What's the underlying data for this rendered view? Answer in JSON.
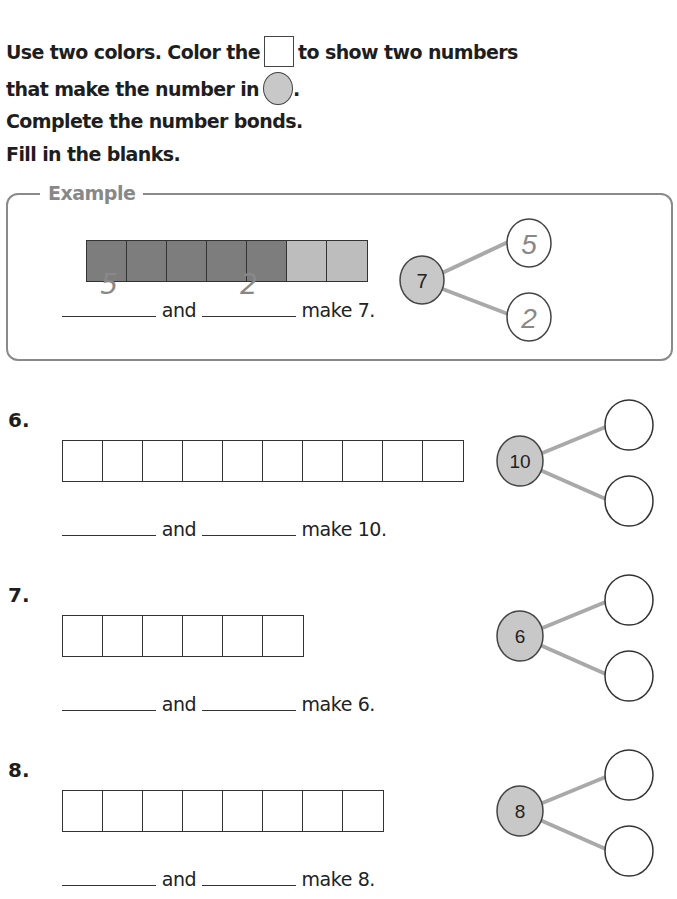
{
  "instructions": {
    "line1_before": "Use two colors. Color the",
    "line1_after": "to show two numbers",
    "line2_before": "that make the number in",
    "line2_after": ".",
    "line3": "Complete the number bonds.",
    "line4": "Fill in the blanks."
  },
  "colors": {
    "dark_fill": "#7d7d7d",
    "light_fill": "#bdbdbd",
    "whole_circle_fill": "#c8c8c8",
    "connector": "#a9a9a9",
    "example_text": "#888888"
  },
  "example": {
    "label": "Example",
    "total": "7",
    "cells": 7,
    "dark_count": 5,
    "part1": "5",
    "part2": "2",
    "and_text": "and",
    "make_text": "make 7."
  },
  "problems": [
    {
      "number": "6.",
      "total": "10",
      "cells": 10,
      "and_text": "and",
      "make_text": "make 10."
    },
    {
      "number": "7.",
      "total": "6",
      "cells": 6,
      "and_text": "and",
      "make_text": "make 6."
    },
    {
      "number": "8.",
      "total": "8",
      "cells": 8,
      "and_text": "and",
      "make_text": "make 8."
    }
  ]
}
